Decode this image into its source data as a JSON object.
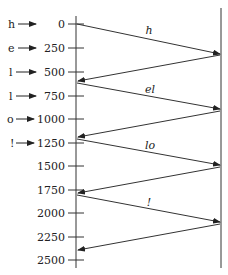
{
  "diagram": {
    "type": "timing-sequence",
    "colors": {
      "line": "#333333",
      "text": "#222222",
      "background": "#ffffff"
    },
    "axis": {
      "ticks": [
        "0",
        "250",
        "500",
        "750",
        "1000",
        "1250",
        "1500",
        "1750",
        "2000",
        "2250",
        "2500"
      ]
    },
    "inputs": [
      {
        "char": "h",
        "tick": "0"
      },
      {
        "char": "e",
        "tick": "250"
      },
      {
        "char": "l",
        "tick": "500"
      },
      {
        "char": "l",
        "tick": "750"
      },
      {
        "char": "o",
        "tick": "1000"
      },
      {
        "char": "!",
        "tick": "1250"
      }
    ],
    "segments": [
      {
        "label": "h"
      },
      {
        "label": "el"
      },
      {
        "label": "lo"
      },
      {
        "label": "!"
      }
    ]
  }
}
